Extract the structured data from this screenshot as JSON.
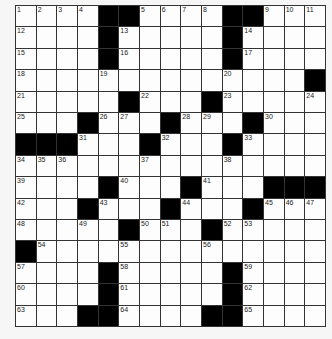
{
  "puzzle": {
    "rows": 15,
    "cols": 15,
    "grid": [
      "....##....##...",
      "....#.....#....",
      "....#.....#....",
      "..............#",
      ".....#...#.....",
      "...#...#...#...",
      "###...#...#....",
      "...............",
      "....#...#...###",
      "...#...#...#...",
      ".....#...#.....",
      "#..............",
      "....#.....#....",
      "....#.....#....",
      "...##....##...."
    ],
    "numbers": [
      [
        1,
        2,
        3,
        4,
        0,
        0,
        5,
        6,
        7,
        8,
        0,
        0,
        9,
        10,
        11
      ],
      [
        12,
        0,
        0,
        0,
        0,
        13,
        0,
        0,
        0,
        0,
        0,
        14,
        0,
        0,
        0
      ],
      [
        15,
        0,
        0,
        0,
        0,
        16,
        0,
        0,
        0,
        0,
        0,
        17,
        0,
        0,
        0
      ],
      [
        18,
        0,
        0,
        0,
        19,
        0,
        0,
        0,
        0,
        0,
        20,
        0,
        0,
        0,
        0
      ],
      [
        21,
        0,
        0,
        0,
        0,
        0,
        22,
        0,
        0,
        0,
        23,
        0,
        0,
        0,
        24
      ],
      [
        25,
        0,
        0,
        0,
        26,
        27,
        0,
        0,
        28,
        29,
        0,
        0,
        30,
        0,
        0
      ],
      [
        0,
        0,
        0,
        31,
        0,
        0,
        0,
        32,
        0,
        0,
        0,
        33,
        0,
        0,
        0
      ],
      [
        34,
        35,
        36,
        0,
        0,
        0,
        37,
        0,
        0,
        0,
        38,
        0,
        0,
        0,
        0
      ],
      [
        39,
        0,
        0,
        0,
        0,
        40,
        0,
        0,
        0,
        41,
        0,
        0,
        0,
        0,
        0
      ],
      [
        42,
        0,
        0,
        0,
        43,
        0,
        0,
        0,
        44,
        0,
        0,
        0,
        45,
        46,
        47
      ],
      [
        48,
        0,
        0,
        49,
        0,
        0,
        50,
        51,
        0,
        0,
        52,
        53,
        0,
        0,
        0
      ],
      [
        0,
        54,
        0,
        0,
        0,
        55,
        0,
        0,
        0,
        56,
        0,
        0,
        0,
        0,
        0
      ],
      [
        57,
        0,
        0,
        0,
        0,
        58,
        0,
        0,
        0,
        0,
        0,
        59,
        0,
        0,
        0
      ],
      [
        60,
        0,
        0,
        0,
        0,
        61,
        0,
        0,
        0,
        0,
        0,
        62,
        0,
        0,
        0
      ],
      [
        63,
        0,
        0,
        0,
        0,
        64,
        0,
        0,
        0,
        0,
        0,
        65,
        0,
        0,
        0
      ]
    ],
    "colors": {
      "background": "#f6f6f6",
      "cell": "#fdfdfd",
      "block": "#000000",
      "line": "#333333",
      "number": "#222222"
    }
  }
}
